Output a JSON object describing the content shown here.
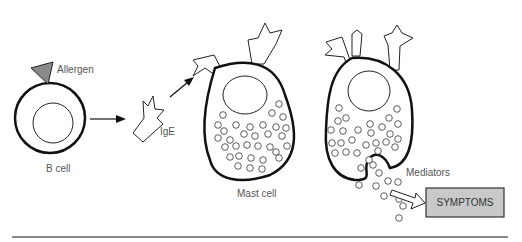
{
  "labels": {
    "allergen": "Allergen",
    "b_cell": "B cell",
    "ige": "IgE",
    "mast_cell": "Mast cell",
    "mediators": "Mediators",
    "symptoms": "SYMPTOMS"
  },
  "colors": {
    "allergen_fill": "#8a8a8a",
    "symptoms_box": "#c9c9c9",
    "outline": "#111111",
    "rule": "#888888"
  }
}
